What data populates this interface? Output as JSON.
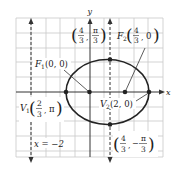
{
  "diagram": {
    "type": "polar-conic-ellipse",
    "axes": {
      "x_label": "x",
      "y_label": "y"
    },
    "directrix": {
      "label": "x = −2"
    },
    "points": {
      "focus1": {
        "name": "F",
        "sub": "1",
        "coords": "(0, 0)"
      },
      "focus2": {
        "name": "F",
        "sub": "2",
        "num": "4",
        "den": "3",
        "second": "0"
      },
      "vertex1": {
        "name": "V",
        "sub": "1",
        "num": "2",
        "den": "3",
        "second": "π"
      },
      "vertex2": {
        "name": "V",
        "sub": "2",
        "coords": "(2, 0)"
      },
      "top": {
        "num1": "4",
        "den1": "3",
        "num2": "π",
        "den2": "3"
      },
      "bottom": {
        "num1": "4",
        "den1": "3",
        "sign2": "−",
        "num2": "π",
        "den2": "3"
      }
    },
    "colors": {
      "grid": "#c8c8c8",
      "axis": "#333333",
      "curve": "#222222"
    }
  }
}
